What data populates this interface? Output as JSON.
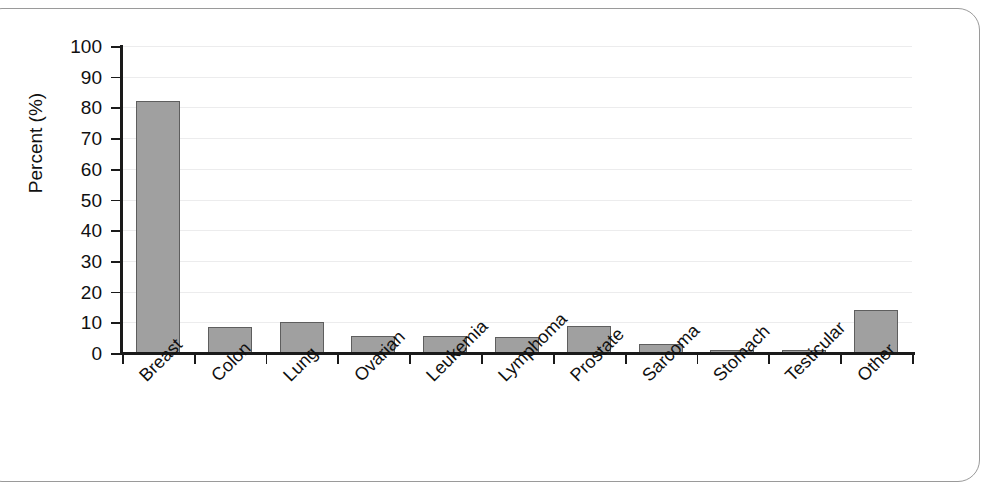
{
  "chart_data": {
    "type": "bar",
    "title": "",
    "xlabel": "",
    "ylabel": "Percent (%)",
    "ylim": [
      0,
      100
    ],
    "grid": true,
    "legend": "none",
    "yticks": [
      0,
      10,
      20,
      30,
      40,
      50,
      60,
      70,
      80,
      90,
      100
    ],
    "ytick_labels": [
      "0",
      "10",
      "20",
      "30",
      "40",
      "50",
      "60",
      "70",
      "80",
      "90",
      "100"
    ],
    "categories": [
      "Breast",
      "Colon",
      "Lung",
      "Ovarian",
      "Leukemia",
      "Lymphoma",
      "Prostate",
      "Sarcoma",
      "Stomach",
      "Testicular",
      "Other"
    ],
    "values": [
      82,
      8.5,
      10,
      5.5,
      5.5,
      5.2,
      8.7,
      2.8,
      1,
      1,
      14
    ],
    "bar_color": "#a0a0a0",
    "bar_edge_color": "#5e5e5e",
    "axis_color": "#1a1a1a",
    "grid_color": "#ececed",
    "frame_color": "#9a9a9a"
  }
}
